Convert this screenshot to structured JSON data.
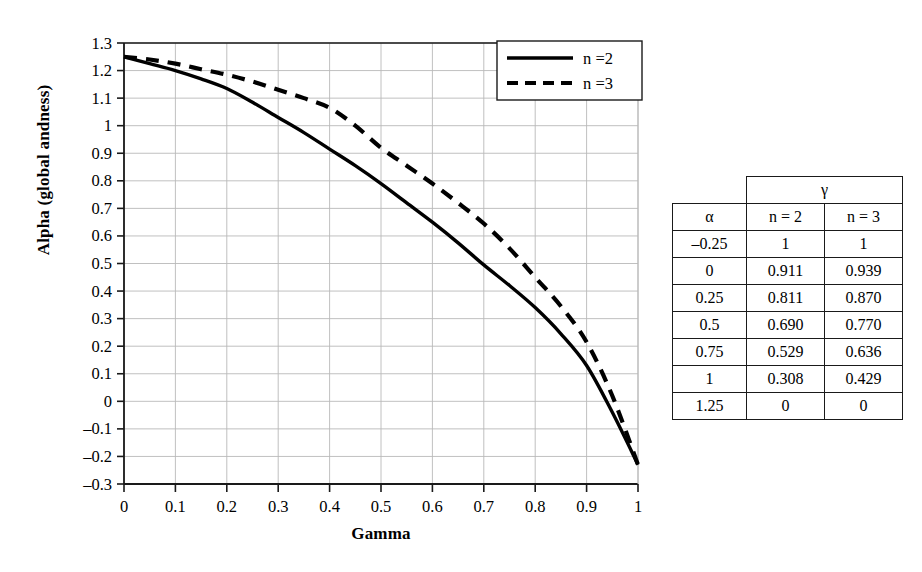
{
  "chart_data": {
    "type": "line",
    "title": "",
    "xlabel": "Gamma",
    "ylabel": "Alpha (global andness)",
    "xlim": [
      0,
      1
    ],
    "ylim": [
      -0.3,
      1.3
    ],
    "grid": true,
    "legend_position": "top-right",
    "x_ticks": [
      "0",
      "0.1",
      "0.2",
      "0.3",
      "0.4",
      "0.5",
      "0.6",
      "0.7",
      "0.8",
      "0.9",
      "1"
    ],
    "y_ticks": [
      "1.3",
      "1.2",
      "1.1",
      "1",
      "0.9",
      "0.8",
      "0.7",
      "0.6",
      "0.5",
      "0.4",
      "0.3",
      "0.2",
      "0.1",
      "0",
      "–0.1",
      "–0.2",
      "–0.3"
    ],
    "x": [
      0,
      0.05,
      0.1,
      0.15,
      0.2,
      0.25,
      0.3,
      0.35,
      0.4,
      0.45,
      0.5,
      0.55,
      0.6,
      0.65,
      0.7,
      0.75,
      0.8,
      0.85,
      0.9,
      0.95,
      1
    ],
    "series": [
      {
        "name": "n = 2",
        "style": "solid",
        "color": "#000000",
        "values": [
          1.25,
          1.225,
          1.2,
          1.17,
          1.135,
          1.085,
          1.03,
          0.975,
          0.915,
          0.855,
          0.79,
          0.72,
          0.65,
          0.575,
          0.495,
          0.42,
          0.34,
          0.245,
          0.13,
          -0.04,
          -0.23
        ]
      },
      {
        "name": "n = 3",
        "style": "dashed",
        "color": "#000000",
        "values": [
          1.25,
          1.24,
          1.225,
          1.205,
          1.185,
          1.16,
          1.13,
          1.1,
          1.065,
          1.0,
          0.92,
          0.855,
          0.79,
          0.72,
          0.645,
          0.555,
          0.45,
          0.345,
          0.215,
          0.02,
          -0.23
        ]
      }
    ]
  },
  "legend": {
    "items": [
      {
        "label": "n =2",
        "style": "solid"
      },
      {
        "label": "n =3",
        "style": "dashed"
      }
    ]
  },
  "table": {
    "span_header": "γ",
    "columns": [
      "α",
      "n = 2",
      "n = 3"
    ],
    "rows": [
      {
        "alpha": "–0.25",
        "n2": "1",
        "n3": "1"
      },
      {
        "alpha": "0",
        "n2": "0.911",
        "n3": "0.939"
      },
      {
        "alpha": "0.25",
        "n2": "0.811",
        "n3": "0.870"
      },
      {
        "alpha": "0.5",
        "n2": "0.690",
        "n3": "0.770"
      },
      {
        "alpha": "0.75",
        "n2": "0.529",
        "n3": "0.636"
      },
      {
        "alpha": "1",
        "n2": "0.308",
        "n3": "0.429"
      },
      {
        "alpha": "1.25",
        "n2": "0",
        "n3": "0"
      }
    ]
  },
  "colors": {
    "curve": "#000000",
    "grid": "#b9b9b9",
    "axis": "#1a1a1a",
    "background": "#ffffff"
  }
}
